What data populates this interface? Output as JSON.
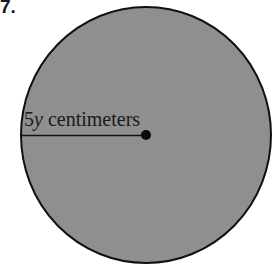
{
  "problem": {
    "number": "7."
  },
  "figure": {
    "shape": "circle",
    "fill_color": "#8f8f8f",
    "stroke_color": "#111111",
    "center": {
      "x": 146,
      "y": 135
    },
    "radius": 126,
    "radius_label": {
      "coefficient": "5",
      "variable": "y",
      "unit": " centimeters"
    }
  }
}
